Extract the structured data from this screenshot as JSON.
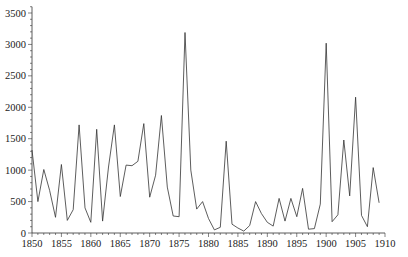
{
  "chart_data": {
    "type": "line",
    "title": "",
    "xlabel": "",
    "ylabel": "",
    "xlim": [
      1850,
      1910
    ],
    "ylim": [
      0,
      3600
    ],
    "grid": false,
    "legend": null,
    "x_ticks": [
      1850,
      1855,
      1860,
      1865,
      1870,
      1875,
      1880,
      1885,
      1890,
      1895,
      1900,
      1905,
      1910
    ],
    "y_ticks": [
      0,
      500,
      1000,
      1500,
      2000,
      2500,
      3000,
      3500
    ],
    "line_color": "#333333",
    "x": [
      1850,
      1851,
      1852,
      1853,
      1854,
      1855,
      1856,
      1857,
      1858,
      1859,
      1860,
      1861,
      1862,
      1863,
      1864,
      1865,
      1866,
      1867,
      1868,
      1869,
      1870,
      1871,
      1872,
      1873,
      1874,
      1875,
      1876,
      1877,
      1878,
      1879,
      1880,
      1881,
      1882,
      1883,
      1884,
      1885,
      1886,
      1887,
      1888,
      1889,
      1890,
      1891,
      1892,
      1893,
      1894,
      1895,
      1896,
      1897,
      1898,
      1899,
      1900,
      1901,
      1902,
      1903,
      1904,
      1905,
      1906,
      1907,
      1908,
      1909
    ],
    "values": [
      1320,
      500,
      1010,
      680,
      250,
      1090,
      200,
      370,
      1720,
      400,
      170,
      1650,
      190,
      1050,
      1720,
      580,
      1080,
      1070,
      1140,
      1740,
      570,
      920,
      1870,
      730,
      270,
      260,
      3190,
      1000,
      380,
      500,
      230,
      50,
      90,
      1460,
      140,
      80,
      30,
      120,
      500,
      310,
      170,
      110,
      550,
      190,
      550,
      260,
      710,
      60,
      70,
      460,
      3020,
      180,
      290,
      1480,
      590,
      2160,
      280,
      100,
      1040,
      480
    ]
  }
}
